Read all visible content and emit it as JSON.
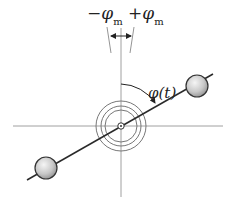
{
  "diagram": {
    "type": "rotating-dumbbell-with-angle",
    "labels": {
      "minus_phi_m": {
        "sign": "−",
        "symbol": "φ",
        "subscript": "m"
      },
      "plus_phi_m": {
        "sign": "+",
        "symbol": "φ",
        "subscript": "m"
      },
      "phi_t": "φ(t)"
    },
    "colors": {
      "axis": "#9a9a9a",
      "rod": "#2a2a2a",
      "ring": "#6e6e6e",
      "ball_fill_light": "#f2f2f2",
      "ball_fill_dark": "#9c9c9c",
      "ball_stroke": "#333333"
    },
    "geometry": {
      "center": [
        121,
        126
      ],
      "ring_radii": [
        16,
        20,
        25
      ],
      "upper_ball": [
        197,
        86
      ],
      "lower_ball": [
        46,
        168
      ],
      "ball_radius": 11
    }
  }
}
